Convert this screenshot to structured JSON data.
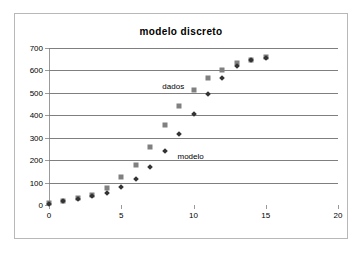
{
  "chart_data": {
    "type": "scatter",
    "title": "modelo discreto",
    "xlabel": "",
    "ylabel": "",
    "xlim": [
      0,
      20
    ],
    "ylim": [
      0,
      700
    ],
    "x_ticks": [
      0,
      5,
      10,
      15,
      20
    ],
    "y_ticks": [
      0,
      100,
      200,
      300,
      400,
      500,
      600,
      700
    ],
    "grid": "horizontal",
    "legend_position": "inline-annotations",
    "annotations": [
      {
        "text": "dados",
        "x": 8.6,
        "y": 530
      },
      {
        "text": "modelo",
        "x": 9.8,
        "y": 218
      }
    ],
    "series": [
      {
        "name": "dados",
        "marker": "square",
        "color": "#808080",
        "x": [
          0,
          1,
          2,
          3,
          4,
          5,
          6,
          7,
          8,
          9,
          10,
          11,
          12,
          13,
          14,
          15
        ],
        "values": [
          8,
          18,
          30,
          45,
          75,
          125,
          180,
          260,
          357,
          443,
          513,
          567,
          602,
          632,
          648,
          658
        ]
      },
      {
        "name": "modelo",
        "marker": "diamond",
        "color": "#333333",
        "x": [
          0,
          1,
          2,
          3,
          4,
          5,
          6,
          7,
          8,
          9,
          10,
          11,
          12,
          13,
          14,
          15
        ],
        "values": [
          6,
          16,
          26,
          40,
          52,
          79,
          115,
          169,
          239,
          317,
          405,
          496,
          568,
          620,
          646,
          656
        ]
      }
    ]
  }
}
